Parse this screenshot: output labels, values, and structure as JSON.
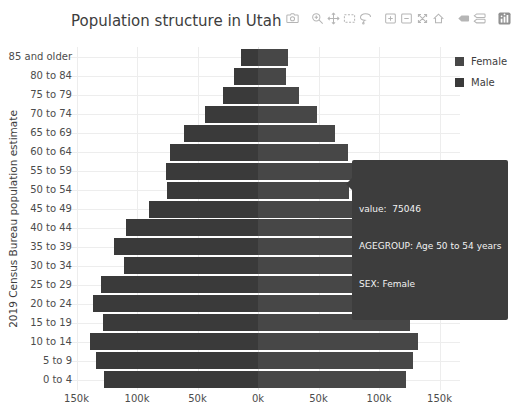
{
  "page": {
    "title": "Population structure in Utah"
  },
  "colors": {
    "male_bar": "#3a3a3a",
    "female_bar": "#474747",
    "tooltip_bg": "#3d3d3d",
    "tooltip_text": "#f2f2f2",
    "grid": "#ededed",
    "zeroline": "#e4e4e4",
    "title_text": "#3d3d3d",
    "tick_text": "#4c4c4c",
    "modebar_icon": "#b5b5b5",
    "plotly_logo_gray": "#919191"
  },
  "modebar": {
    "groups": [
      [
        "camera-icon"
      ],
      [
        "zoom-icon",
        "pan-icon",
        "box-select-icon",
        "lasso-select-icon"
      ],
      [
        "zoom-in-icon",
        "zoom-out-icon",
        "autoscale-icon",
        "reset-axes-icon"
      ],
      [
        "hover-closest-icon",
        "hover-compare-icon"
      ],
      [
        "plotly-logo-icon"
      ]
    ]
  },
  "legend": {
    "items": [
      {
        "label": "Female",
        "color": "#474747"
      },
      {
        "label": "Male",
        "color": "#3a3a3a"
      }
    ]
  },
  "tooltip": {
    "lines": [
      "value:  75046",
      "AGEGROUP: Age 50 to 54 years",
      "SEX: Female"
    ]
  },
  "chart_data": {
    "type": "bar",
    "subtype": "population-pyramid",
    "orientation": "horizontal",
    "title": "Population structure in Utah",
    "xlabel": "",
    "ylabel": "2019 Census Bureau population estimate",
    "legend_position": "top-right",
    "grid": true,
    "categories": [
      "85 and older",
      "80 to 84",
      "75 to 79",
      "70 to 74",
      "65 to 69",
      "60 to 64",
      "55 to 59",
      "50 to 54",
      "45 to 49",
      "40 to 44",
      "35 to 39",
      "30 to 34",
      "25 to 29",
      "20 to 24",
      "15 to 19",
      "10 to 14",
      "5 to 9",
      "0 to 4"
    ],
    "series": [
      {
        "name": "Male",
        "side": "left",
        "color": "#3a3a3a",
        "values": [
          14000,
          20000,
          29000,
          44000,
          61000,
          73000,
          76000,
          75000,
          90000,
          109000,
          119000,
          111000,
          130000,
          136000,
          128000,
          139000,
          134000,
          127000
        ]
      },
      {
        "name": "Female",
        "side": "right",
        "color": "#474747",
        "values": [
          25000,
          23000,
          34000,
          49000,
          64000,
          74000,
          78000,
          75046,
          89000,
          105000,
          115000,
          110000,
          124000,
          131000,
          126000,
          132000,
          128000,
          122000
        ]
      }
    ],
    "x_ticks": [
      {
        "label": "150k",
        "value": -150000
      },
      {
        "label": "100k",
        "value": -100000
      },
      {
        "label": "50k",
        "value": -50000
      },
      {
        "label": "0k",
        "value": 0
      },
      {
        "label": "50k",
        "value": 50000
      },
      {
        "label": "100k",
        "value": 100000
      },
      {
        "label": "150k",
        "value": 150000
      }
    ],
    "xlim": [
      -155000,
      167000
    ],
    "highlighted_point": {
      "series": "Female",
      "category": "50 to 54",
      "value": 75046
    }
  }
}
